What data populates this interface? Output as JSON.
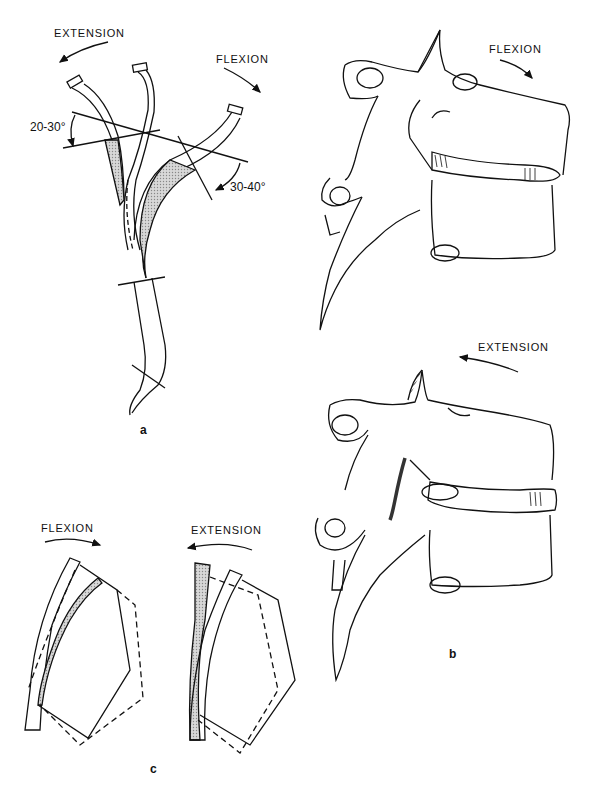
{
  "figure": {
    "panel_a": {
      "label": "a",
      "extension_label": "EXTENSION",
      "flexion_label": "FLEXION",
      "extension_angle": "20-30°",
      "flexion_angle": "30-40°"
    },
    "panel_b": {
      "label": "b",
      "flexion_label": "FLEXION",
      "extension_label": "EXTENSION"
    },
    "panel_c": {
      "label": "c",
      "flexion_label": "FLEXION",
      "extension_label": "EXTENSION"
    }
  },
  "colors": {
    "line": "#111111",
    "shade": "#b8b8b8",
    "background": "#ffffff"
  }
}
